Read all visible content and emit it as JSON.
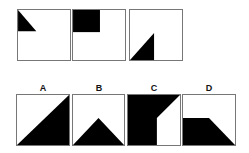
{
  "sequence": [
    {
      "id": "seq1",
      "shape": "0,0 0,22 19,22"
    },
    {
      "id": "seq2",
      "shape": "0,0 0,23 28,23 28,0"
    },
    {
      "id": "seq3",
      "shape": "0,52 25,52 25,24"
    }
  ],
  "options": [
    {
      "label": "A",
      "shape": "0,52 54,52 54,0"
    },
    {
      "label": "B",
      "shape": "0,52 54,52 27,24"
    },
    {
      "label": "C",
      "shape": "0,0 54,0 30,24 30,52 0,52"
    },
    {
      "label": "D",
      "shape": "0,24 27,24 54,52 0,52"
    }
  ]
}
